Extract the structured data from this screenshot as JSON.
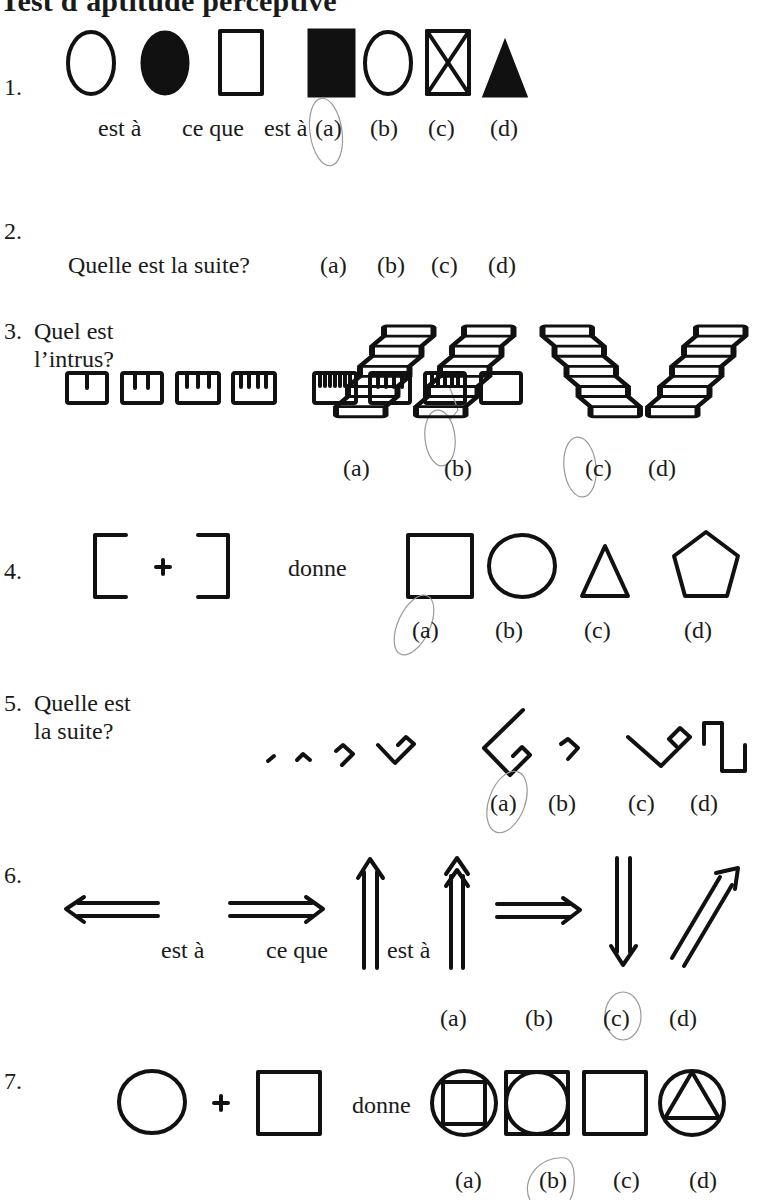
{
  "title": "Test d'aptitude perceptive",
  "questions": [
    {
      "number": "1.",
      "texts": [
        "est à",
        "ce que",
        "est à"
      ],
      "options": [
        "(a)",
        "(b)",
        "(c)",
        "(d)"
      ],
      "marked_answer": "(a)"
    },
    {
      "number": "2.",
      "prompt": "Quelle est la suite?",
      "options": [
        "(a)",
        "(b)",
        "(c)",
        "(d)"
      ],
      "marked_answer": "(c)"
    },
    {
      "number": "3.",
      "prompt_line1": "Quel est",
      "prompt_line2": "l’intrus?",
      "options": [
        "(a)",
        "(b)",
        "(c)",
        "(d)"
      ],
      "marked_answer": "(c)"
    },
    {
      "number": "4.",
      "texts": [
        "donne"
      ],
      "options": [
        "(a)",
        "(b)",
        "(c)",
        "(d)"
      ],
      "marked_answer": "(a)"
    },
    {
      "number": "5.",
      "prompt_line1": "Quelle est",
      "prompt_line2": "la suite?",
      "options": [
        "(a)",
        "(b)",
        "(c)",
        "(d)"
      ],
      "marked_answer": "(a)"
    },
    {
      "number": "6.",
      "texts": [
        "est à",
        "ce que",
        "est à"
      ],
      "options": [
        "(a)",
        "(b)",
        "(c)",
        "(d)"
      ],
      "marked_answer": "(c)"
    },
    {
      "number": "7.",
      "texts": [
        "donne"
      ],
      "options": [
        "(a)",
        "(b)",
        "(c)",
        "(d)"
      ],
      "marked_answer": "(b)"
    }
  ]
}
